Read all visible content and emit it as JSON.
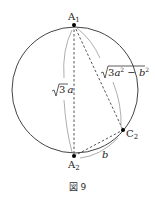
{
  "figure": {
    "caption": "図 9",
    "points": {
      "A1": {
        "label": "A",
        "sub": "1",
        "x": 74,
        "y": 25
      },
      "A2": {
        "label": "A",
        "sub": "2",
        "x": 74,
        "y": 156
      },
      "C2": {
        "label": "C",
        "sub": "2",
        "x": 123,
        "y": 130
      }
    },
    "circle": {
      "cx": 75,
      "cy": 90,
      "r": 63
    },
    "segments": [
      {
        "from": "A1",
        "to": "A2",
        "style": "dashed",
        "length_label": "√3 a"
      },
      {
        "from": "A1",
        "to": "C2",
        "style": "dashed",
        "length_label": "√(3a² − b²)"
      },
      {
        "from": "A2",
        "to": "C2",
        "style": "dashed",
        "length_label": "b"
      }
    ],
    "labels": {
      "sqrt3a_radicand": "3",
      "sqrt3a_var": "a",
      "long_radicand_coef": "3",
      "long_a": "a",
      "long_exp": "2",
      "long_minus": " − ",
      "long_b": "b",
      "b_label": "b"
    },
    "colors": {
      "line": "#333333",
      "brace": "#9a9a9a",
      "point": "#000000"
    }
  }
}
